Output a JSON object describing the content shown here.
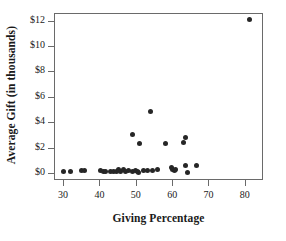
{
  "chart_data": {
    "type": "scatter",
    "title": "",
    "xlabel": "Giving Percentage",
    "ylabel": "Average Gift (in thousands)",
    "xlim": [
      27.5,
      85.0
    ],
    "ylim": [
      -0.55,
      12.6
    ],
    "xticks": [
      30,
      40,
      50,
      60,
      70,
      80
    ],
    "xtick_labels": [
      "30",
      "40",
      "50",
      "60",
      "70",
      "80"
    ],
    "yticks": [
      0,
      2,
      4,
      6,
      8,
      10,
      12
    ],
    "ytick_labels": [
      "$0",
      "$2",
      "$4",
      "$6",
      "$8",
      "$10",
      "$12"
    ],
    "grid": false,
    "legend": null,
    "marker_color": "#262626",
    "frame_color": "#6a6a6a",
    "points": [
      {
        "x": 30.0,
        "y": 0.1
      },
      {
        "x": 32.0,
        "y": 0.1
      },
      {
        "x": 35.2,
        "y": 0.18
      },
      {
        "x": 36.0,
        "y": 0.18
      },
      {
        "x": 40.2,
        "y": 0.2
      },
      {
        "x": 41.0,
        "y": 0.12
      },
      {
        "x": 41.6,
        "y": 0.1
      },
      {
        "x": 43.0,
        "y": 0.15
      },
      {
        "x": 43.8,
        "y": 0.08
      },
      {
        "x": 44.6,
        "y": 0.1
      },
      {
        "x": 45.2,
        "y": 0.25
      },
      {
        "x": 45.8,
        "y": 0.12
      },
      {
        "x": 46.6,
        "y": 0.28
      },
      {
        "x": 47.2,
        "y": 0.15
      },
      {
        "x": 48.0,
        "y": 0.22
      },
      {
        "x": 49.0,
        "y": 0.1
      },
      {
        "x": 50.0,
        "y": 0.2
      },
      {
        "x": 50.4,
        "y": 0.08
      },
      {
        "x": 50.8,
        "y": 0.05
      },
      {
        "x": 52.2,
        "y": 0.22
      },
      {
        "x": 53.2,
        "y": 0.22
      },
      {
        "x": 54.6,
        "y": 0.18
      },
      {
        "x": 56.0,
        "y": 0.28
      },
      {
        "x": 59.8,
        "y": 0.45
      },
      {
        "x": 60.2,
        "y": 0.25
      },
      {
        "x": 60.6,
        "y": 0.22
      },
      {
        "x": 61.0,
        "y": 0.3
      },
      {
        "x": 63.6,
        "y": 0.58
      },
      {
        "x": 64.2,
        "y": 0.05
      },
      {
        "x": 66.8,
        "y": 0.58
      },
      {
        "x": 49.2,
        "y": 3.02
      },
      {
        "x": 51.0,
        "y": 2.35
      },
      {
        "x": 54.0,
        "y": 4.85
      },
      {
        "x": 58.2,
        "y": 2.35
      },
      {
        "x": 63.0,
        "y": 2.42
      },
      {
        "x": 63.8,
        "y": 2.78
      },
      {
        "x": 81.4,
        "y": 12.05
      }
    ]
  }
}
